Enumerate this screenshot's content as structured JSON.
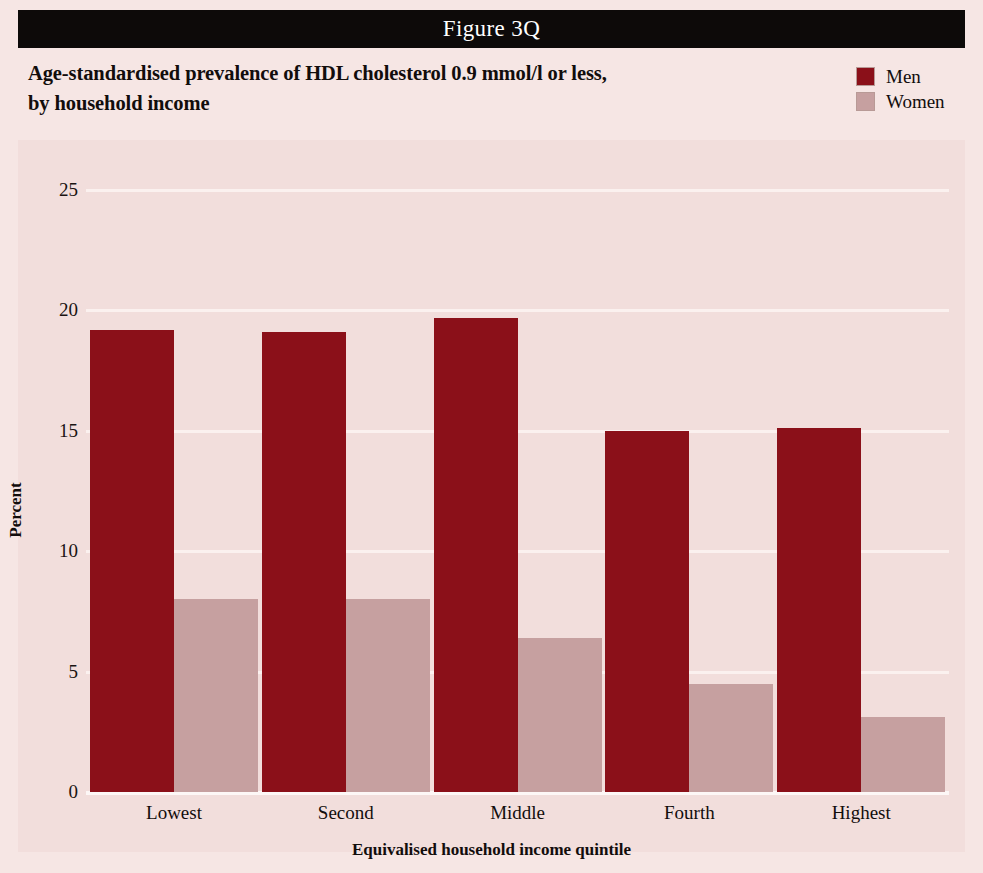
{
  "figure": {
    "label": "Figure 3Q"
  },
  "title": {
    "line1": "Age-standardised prevalence of HDL cholesterol 0.9 mmol/l or less,",
    "line2": "by household income"
  },
  "legend": {
    "position": "top-right",
    "items": [
      {
        "label": "Men",
        "color": "#8b1019"
      },
      {
        "label": "Women",
        "color": "#c6a0a0"
      }
    ]
  },
  "colors": {
    "page_background": "#f6e6e4",
    "plot_background": "#f2dedc",
    "gridline": "#fbf1ef",
    "header_bar": "#0d0a09",
    "men": "#8b1019",
    "women": "#c6a0a0",
    "text": "#120d0c"
  },
  "axes": {
    "y_title": "Percent",
    "x_title": "Equivalised household income quintile",
    "y_ticks": [
      "0",
      "5",
      "10",
      "15",
      "20",
      "25"
    ]
  },
  "chart_data": {
    "type": "bar",
    "title": "Age-standardised prevalence of HDL cholesterol 0.9 mmol/l or less, by household income",
    "xlabel": "Equivalised household income quintile",
    "ylabel": "Percent",
    "ylim": [
      0,
      25
    ],
    "yticks": [
      0,
      5,
      10,
      15,
      20,
      25
    ],
    "grid": true,
    "legend_position": "top-right",
    "categories": [
      "Lowest",
      "Second",
      "Middle",
      "Fourth",
      "Highest"
    ],
    "series": [
      {
        "name": "Men",
        "color": "#8b1019",
        "values": [
          19.2,
          19.1,
          19.7,
          15.0,
          15.1
        ]
      },
      {
        "name": "Women",
        "color": "#c6a0a0",
        "values": [
          8.0,
          8.0,
          6.4,
          4.5,
          3.1
        ]
      }
    ]
  }
}
